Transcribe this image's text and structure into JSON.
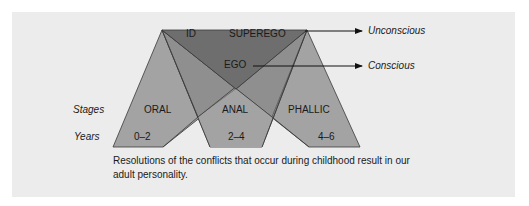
{
  "diagram": {
    "structures": {
      "id": "ID",
      "superego": "SUPEREGO",
      "ego": "EGO"
    },
    "levels": {
      "unconscious": "Unconscious",
      "conscious": "Conscious"
    },
    "row_labels": {
      "stages": "Stages",
      "years": "Years"
    },
    "stages": [
      {
        "name": "ORAL",
        "years": "0–2"
      },
      {
        "name": "ANAL",
        "years": "2–4"
      },
      {
        "name": "PHALLIC",
        "years": "4–6"
      }
    ],
    "caption": "Resolutions of the conflicts that occur during childhood result in our adult personality.",
    "colors": {
      "panel_bg": "#ececec",
      "dark_triangle": "#6e6e6e",
      "stage_fill": "#a3a3a3",
      "overlap_fill": "#8c8c8c",
      "outline": "#3a3a3a",
      "arrow": "#111111"
    }
  }
}
